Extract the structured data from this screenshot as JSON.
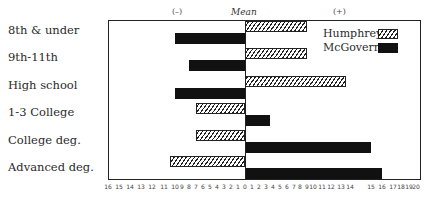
{
  "chart_data": {
    "type": "bar",
    "orientation": "horizontal-diverging",
    "title": "",
    "header": {
      "negative": "(–)",
      "center": "Mean",
      "positive": "(+)"
    },
    "categories": [
      "8th & under",
      "9th-11th",
      "High school",
      "1-3 College",
      "College deg.",
      "Advanced deg."
    ],
    "series": [
      {
        "name": "Humphrey",
        "style": "hatched",
        "values": [
          9,
          9,
          13.5,
          -7,
          -7,
          -10.5
        ]
      },
      {
        "name": "McGovern",
        "style": "solid",
        "color": "#111111",
        "values": [
          -10,
          -8,
          -10,
          3.5,
          15,
          16
        ]
      }
    ],
    "xlabel": "",
    "ylabel": "",
    "xlim": [
      -16,
      20
    ],
    "x_ticks_left": [
      16,
      15,
      14,
      13,
      12,
      11,
      10,
      9,
      8,
      7,
      6,
      5,
      4,
      3,
      2,
      1,
      0
    ],
    "x_ticks_right": [
      1,
      2,
      3,
      4,
      5,
      6,
      7,
      8,
      9,
      10,
      11,
      12,
      13,
      14,
      15,
      16,
      17,
      18,
      19,
      20
    ],
    "legend": {
      "position": "upper-right",
      "entries": [
        "Humphrey",
        "McGovern"
      ]
    },
    "grid": false
  }
}
